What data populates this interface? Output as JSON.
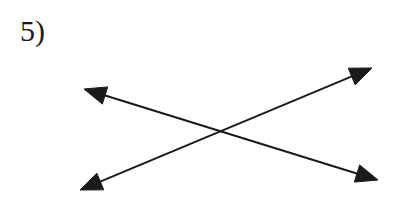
{
  "figure": {
    "label": "5)",
    "background_color": "#ffffff",
    "ink_color": "#1a1a1a",
    "width": 401,
    "height": 216,
    "stroke_width": 2,
    "arrowhead_length": 22,
    "arrowhead_half_width": 9,
    "label_position": {
      "x": 20,
      "y": 16
    },
    "label_font_size": 30,
    "intersection": {
      "x": 225,
      "y": 134
    },
    "lines": [
      {
        "name": "line-descending",
        "from": {
          "x": 84,
          "y": 89
        },
        "to": {
          "x": 378,
          "y": 180
        },
        "arrow_start": true,
        "arrow_end": true,
        "start_arrow_name": "arrowhead-upper-left",
        "end_arrow_name": "arrowhead-lower-right"
      },
      {
        "name": "line-ascending",
        "from": {
          "x": 80,
          "y": 190
        },
        "to": {
          "x": 372,
          "y": 68
        },
        "arrow_start": true,
        "arrow_end": true,
        "start_arrow_name": "arrowhead-lower-left",
        "end_arrow_name": "arrowhead-upper-right"
      }
    ]
  }
}
